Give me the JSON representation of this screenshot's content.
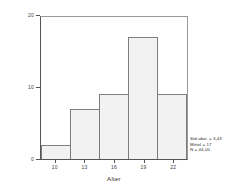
{
  "chart_data": {
    "type": "bar",
    "title": "",
    "subtitle": "",
    "xlabel": "Alter",
    "ylabel": "Häufigkeit",
    "categories": [
      "10",
      "13",
      "16",
      "19",
      "22"
    ],
    "values": [
      2,
      7,
      9,
      17,
      9
    ],
    "series": [
      {
        "name": "Häufigkeit",
        "values": [
          2,
          7,
          9,
          17,
          9
        ]
      }
    ],
    "xlim": [
      8.5,
      23.5
    ],
    "ylim": [
      0,
      20
    ],
    "ytick_labels": [
      "0",
      "10",
      "20"
    ],
    "ytick_values": [
      0,
      10,
      20
    ],
    "xtick_labels": [
      "10",
      "13",
      "16",
      "19",
      "22"
    ],
    "xtick_values": [
      10,
      13,
      16,
      19,
      22
    ],
    "grid": false,
    "legend": null,
    "bar_fill_color": "#f2f2f2",
    "bar_edge_color": "#7d7d7d",
    "axis_color": "#555555",
    "text_color": "#2e2e2e",
    "background_color": "#ffffff",
    "annotations": [
      "Std.abw. = 3,43",
      "Mittel = 17",
      "N = 44,00"
    ]
  },
  "axes": {
    "x_title": "Alter",
    "y_title": "Häufigkeit"
  },
  "stats": {
    "std_dev": "Std.abw. = 3,43",
    "mean": "Mittel = 17",
    "n": "N = 44,00"
  }
}
